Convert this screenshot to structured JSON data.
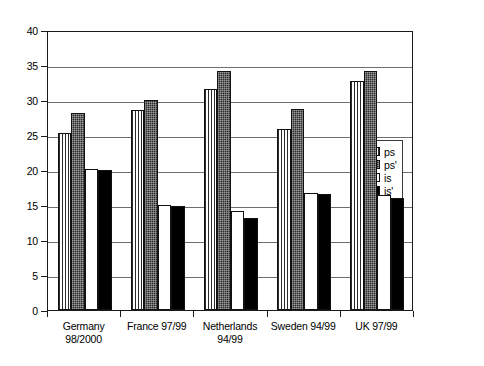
{
  "chart_data": {
    "type": "bar",
    "title": "",
    "xlabel": "",
    "ylabel": "",
    "ylim": [
      0,
      40
    ],
    "yticks": [
      0,
      5,
      10,
      15,
      20,
      25,
      30,
      35,
      40
    ],
    "grid": true,
    "legend_position": "right-inside",
    "categories": [
      "Germany 98/2000",
      "France 97/99",
      "Netherlands 94/99",
      "Sweden 94/99",
      "UK 97/99"
    ],
    "category_lines": [
      [
        "Germany",
        "98/2000"
      ],
      [
        "France 97/99"
      ],
      [
        "Netherlands",
        "94/99"
      ],
      [
        "Sweden 94/99"
      ],
      [
        "UK 97/99"
      ]
    ],
    "series": [
      {
        "name": "ps",
        "fill": "vertical-pinstripe",
        "values": [
          25.3,
          28.6,
          31.6,
          25.9,
          32.7
        ]
      },
      {
        "name": "ps'",
        "fill": "dark-stipple",
        "values": [
          28.1,
          30.0,
          34.2,
          28.7,
          34.2
        ]
      },
      {
        "name": "is",
        "fill": "white",
        "values": [
          20.2,
          15.0,
          14.1,
          16.7,
          16.5
        ]
      },
      {
        "name": "is'",
        "fill": "black-solid",
        "values": [
          20.0,
          14.8,
          13.1,
          16.6,
          16.0
        ]
      }
    ]
  },
  "legend": {
    "items": [
      {
        "label": "ps",
        "fill": "vertical-pinstripe"
      },
      {
        "label": "ps'",
        "fill": "dark-stipple"
      },
      {
        "label": "is",
        "fill": "white"
      },
      {
        "label": "is'",
        "fill": "black-solid"
      }
    ]
  }
}
